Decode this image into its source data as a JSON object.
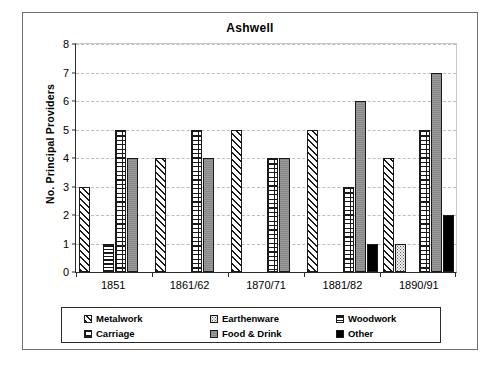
{
  "chart_data": {
    "type": "bar",
    "title": "Ashwell",
    "xlabel": "",
    "ylabel": "No. Principal Providers",
    "categories": [
      "1851",
      "1861/62",
      "1870/71",
      "1881/82",
      "1890/91"
    ],
    "ylim": [
      0,
      8
    ],
    "yticks": [
      "0",
      "1",
      "2",
      "3",
      "4",
      "5",
      "6",
      "7",
      "8"
    ],
    "grid": true,
    "legend_position": "bottom",
    "series": [
      {
        "name": "Metalwork",
        "color": "#ffffff",
        "pattern": "diagonal-hatch",
        "values": [
          3,
          4,
          5,
          5,
          4
        ]
      },
      {
        "name": "Earthenware",
        "color": "#f2f2f2",
        "pattern": "dotted",
        "values": [
          0,
          0,
          0,
          0,
          1
        ]
      },
      {
        "name": "Woodwork",
        "color": "#ffffff",
        "pattern": "horizontal-lines",
        "values": [
          1,
          0,
          0,
          0,
          0
        ]
      },
      {
        "name": "Carriage",
        "color": "#ffffff",
        "pattern": "brick-grid",
        "values": [
          5,
          5,
          4,
          3,
          5
        ]
      },
      {
        "name": "Food & Drink",
        "color": "#9a9a9a",
        "pattern": "solid-gray",
        "values": [
          4,
          4,
          4,
          6,
          7
        ]
      },
      {
        "name": "Other",
        "color": "#000000",
        "pattern": "solid-black",
        "values": [
          0,
          0,
          0,
          1,
          2
        ]
      }
    ]
  },
  "legend": {
    "items": [
      {
        "label": "Metalwork"
      },
      {
        "label": "Earthenware"
      },
      {
        "label": "Woodwork"
      },
      {
        "label": "Carriage"
      },
      {
        "label": "Food & Drink"
      },
      {
        "label": "Other"
      }
    ]
  }
}
